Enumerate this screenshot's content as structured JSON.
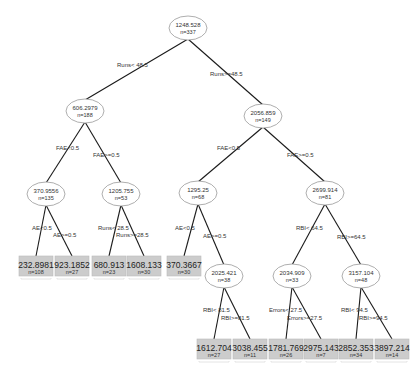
{
  "diagram": {
    "type": "regression-tree",
    "colors": {
      "edge": "#1a1a1a",
      "node_border": "#999999",
      "leaf_fill": "#cccccc",
      "text": "#333333"
    },
    "nodes": [
      {
        "id": "n0",
        "value": "1248.528",
        "n": "n=337",
        "x": 188,
        "y": 28,
        "leaf": false
      },
      {
        "id": "n1",
        "value": "606.2979",
        "n": "n=188",
        "x": 85,
        "y": 111,
        "leaf": false
      },
      {
        "id": "n2",
        "value": "2056.859",
        "n": "n=149",
        "x": 263,
        "y": 116,
        "leaf": false
      },
      {
        "id": "n3",
        "value": "370.9556",
        "n": "n=135",
        "x": 46,
        "y": 194,
        "leaf": false
      },
      {
        "id": "n4",
        "value": "1205.755",
        "n": "n=53",
        "x": 121,
        "y": 194,
        "leaf": false
      },
      {
        "id": "n5",
        "value": "1295.25",
        "n": "n=68",
        "x": 198,
        "y": 193,
        "leaf": false
      },
      {
        "id": "n6",
        "value": "2699.914",
        "n": "n=81",
        "x": 325,
        "y": 193,
        "leaf": false
      },
      {
        "id": "l1",
        "value": "232.8981",
        "n": "n=108",
        "x": 36,
        "y": 272,
        "leaf": true
      },
      {
        "id": "l2",
        "value": "923.1852",
        "n": "n=27",
        "x": 72,
        "y": 272,
        "leaf": true
      },
      {
        "id": "l3",
        "value": "680.913",
        "n": "n=23",
        "x": 109,
        "y": 272,
        "leaf": true
      },
      {
        "id": "l4",
        "value": "1608.133",
        "n": "n=30",
        "x": 144,
        "y": 272,
        "leaf": true
      },
      {
        "id": "l5",
        "value": "370.3667",
        "n": "n=30",
        "x": 184,
        "y": 272,
        "leaf": true
      },
      {
        "id": "n7",
        "value": "2025.421",
        "n": "n=38",
        "x": 224,
        "y": 276,
        "leaf": false
      },
      {
        "id": "n8",
        "value": "2034.909",
        "n": "n=33",
        "x": 292,
        "y": 276,
        "leaf": false
      },
      {
        "id": "n9",
        "value": "3157.104",
        "n": "n=48",
        "x": 361,
        "y": 276,
        "leaf": false
      },
      {
        "id": "l6",
        "value": "1612.704",
        "n": "n=27",
        "x": 214,
        "y": 355,
        "leaf": true
      },
      {
        "id": "l7",
        "value": "3038.455",
        "n": "n=11",
        "x": 250,
        "y": 355,
        "leaf": true
      },
      {
        "id": "l8",
        "value": "1781.769",
        "n": "n=26",
        "x": 286,
        "y": 355,
        "leaf": true
      },
      {
        "id": "l9",
        "value": "2975.143",
        "n": "n=7",
        "x": 321,
        "y": 355,
        "leaf": true
      },
      {
        "id": "l10",
        "value": "2852.353",
        "n": "n=34",
        "x": 356,
        "y": 355,
        "leaf": true
      },
      {
        "id": "l11",
        "value": "3897.214",
        "n": "n=14",
        "x": 392,
        "y": 355,
        "leaf": true
      }
    ],
    "edges": [
      {
        "from": "n0",
        "to": "n1",
        "label": "Runs< 48.5",
        "lx": 117,
        "ly": 67
      },
      {
        "from": "n0",
        "to": "n2",
        "label": "Runs>=48.5",
        "lx": 210,
        "ly": 76
      },
      {
        "from": "n1",
        "to": "n3",
        "label": "FAE<0.5",
        "lx": 56,
        "ly": 150
      },
      {
        "from": "n1",
        "to": "n4",
        "label": "FAE>=0.5",
        "lx": 93,
        "ly": 157
      },
      {
        "from": "n2",
        "to": "n5",
        "label": "FAE<0.5",
        "lx": 217,
        "ly": 150
      },
      {
        "from": "n2",
        "to": "n6",
        "label": "FAE>=0.5",
        "lx": 287,
        "ly": 157
      },
      {
        "from": "n3",
        "to": "l1",
        "label": "AE<0.5",
        "lx": 32,
        "ly": 230
      },
      {
        "from": "n3",
        "to": "l2",
        "label": "AE>=0.5",
        "lx": 53,
        "ly": 237
      },
      {
        "from": "n4",
        "to": "l3",
        "label": "Runs< 28.5",
        "lx": 98,
        "ly": 230
      },
      {
        "from": "n4",
        "to": "l4",
        "label": "Runs>=28.5",
        "lx": 116,
        "ly": 237
      },
      {
        "from": "n5",
        "to": "l5",
        "label": "AE<0.5",
        "lx": 175,
        "ly": 230
      },
      {
        "from": "n5",
        "to": "n7",
        "label": "AE>=0.5",
        "lx": 203,
        "ly": 238
      },
      {
        "from": "n6",
        "to": "n8",
        "label": "RBI< 64.5",
        "lx": 296,
        "ly": 230
      },
      {
        "from": "n6",
        "to": "n9",
        "label": "RBI>=64.5",
        "lx": 337,
        "ly": 239
      },
      {
        "from": "n7",
        "to": "l6",
        "label": "RBI< 81.5",
        "lx": 203,
        "ly": 312
      },
      {
        "from": "n7",
        "to": "l7",
        "label": "RBI>=81.5",
        "lx": 221,
        "ly": 320
      },
      {
        "from": "n8",
        "to": "l8",
        "label": "Errors< 27.5",
        "lx": 269,
        "ly": 312
      },
      {
        "from": "n8",
        "to": "l9",
        "label": "Errors>=27.5",
        "lx": 287,
        "ly": 320
      },
      {
        "from": "n9",
        "to": "l10",
        "label": "RBI< 94.5",
        "lx": 341,
        "ly": 312
      },
      {
        "from": "n9",
        "to": "l11",
        "label": "RBI>=94.5",
        "lx": 359,
        "ly": 320
      }
    ]
  }
}
